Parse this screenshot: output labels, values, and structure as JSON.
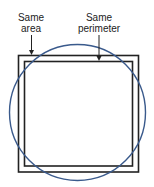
{
  "diagram": {
    "labels": {
      "same_area_line1": "Same",
      "same_area_line2": "area",
      "same_perimeter_line1": "Same",
      "same_perimeter_line2": "perimeter"
    },
    "shapes": {
      "outer_square": {
        "description": "Square with same area as circle",
        "color": "#222222"
      },
      "inner_square": {
        "description": "Square with same perimeter as circle",
        "color": "#222222"
      },
      "circle": {
        "description": "Circle",
        "color": "#3a5a8c"
      }
    }
  }
}
